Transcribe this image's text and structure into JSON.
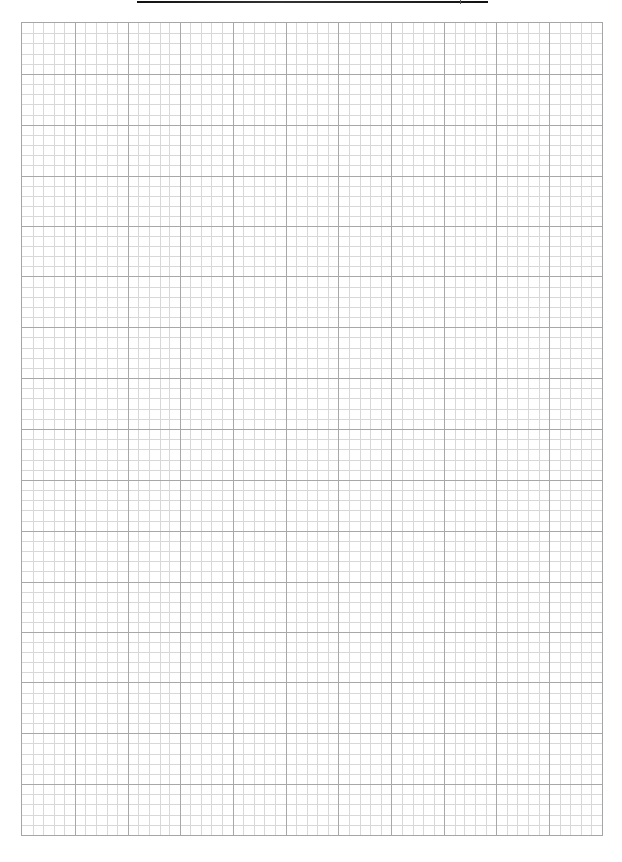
{
  "page": {
    "type": "graph-paper",
    "background_color": "#ffffff"
  },
  "title_rule": {
    "color": "#1a1a1a"
  },
  "grid": {
    "major_columns": 11,
    "major_rows": 16,
    "minor_per_major": 5,
    "major_line_color": "#a8a8a8",
    "minor_line_color": "#d8d8d8",
    "border_color": "#a6a6a6"
  }
}
